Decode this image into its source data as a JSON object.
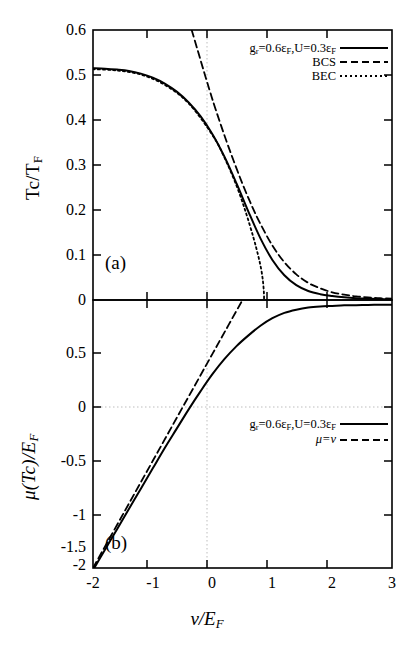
{
  "figure": {
    "panels": [
      "(a)",
      "(b)"
    ],
    "xaxis": {
      "label_html": "&nu;/E<sub>F</sub>",
      "min": -2,
      "max": 3,
      "ticks": [
        "-2",
        "-1",
        "0",
        "1",
        "2",
        "3"
      ]
    },
    "panel_a": {
      "label": "(a)",
      "ylabel_html": "Tc/T<sub>F</sub>",
      "yticks": [
        "0.6",
        "0.5",
        "0.4",
        "0.3",
        "0.2",
        "0.1",
        "0"
      ],
      "ymin": 0,
      "ymax": 0.6,
      "legend": [
        {
          "label_html": "g<sub>r</sub>=0.6&epsilon;<sub>F</sub>,U=0.3&epsilon;<sub>F</sub>",
          "style": "solid"
        },
        {
          "label_html": "BCS",
          "style": "dashed"
        },
        {
          "label_html": "BEC",
          "style": "dotted"
        }
      ]
    },
    "panel_b": {
      "label": "(b)",
      "ylabel_html": "&mu;(Tc)/E<sub>F</sub>",
      "yticks": [
        "0.5",
        "0",
        "-0.5",
        "-1",
        "-1.5",
        "-2"
      ],
      "ymin": -2,
      "ymax": 0.5,
      "legend": [
        {
          "label_html": "g<sub>r</sub>=0.6&epsilon;<sub>F</sub>,U=0.3&epsilon;<sub>F</sub>",
          "style": "solid"
        },
        {
          "label_html": "&mu;=&nu;",
          "style": "dashed"
        }
      ]
    },
    "colors": {
      "ink": "#000000",
      "grid": "#bdbdbd"
    }
  },
  "chart_data": {
    "type": "line",
    "title": "",
    "xlabel": "nu/E_F",
    "xlim": [
      -2,
      3
    ],
    "panels": [
      {
        "name": "(a)",
        "ylabel": "Tc/T_F",
        "ylim": [
          0,
          0.6
        ],
        "yticks": [
          0,
          0.1,
          0.2,
          0.3,
          0.4,
          0.5,
          0.6
        ],
        "xticks": [
          -2,
          -1,
          0,
          1,
          2,
          3
        ],
        "gridlines": {
          "vertical": [
            -0.15
          ],
          "horizontal": []
        },
        "series": [
          {
            "name": "g_r=0.6eps_F,U=0.3eps_F",
            "style": "solid",
            "x": [
              -2.0,
              -1.8,
              -1.6,
              -1.4,
              -1.2,
              -1.0,
              -0.8,
              -0.6,
              -0.4,
              -0.2,
              0.0,
              0.2,
              0.4,
              0.6,
              0.8,
              1.0,
              1.2,
              1.4,
              1.6,
              1.8,
              2.0,
              2.2,
              2.4,
              2.6,
              2.8,
              3.0
            ],
            "y": [
              0.515,
              0.514,
              0.512,
              0.509,
              0.503,
              0.494,
              0.481,
              0.463,
              0.439,
              0.408,
              0.368,
              0.318,
              0.259,
              0.196,
              0.137,
              0.089,
              0.055,
              0.033,
              0.02,
              0.013,
              0.009,
              0.006,
              0.004,
              0.003,
              0.002,
              0.002
            ]
          },
          {
            "name": "BCS",
            "style": "dashed",
            "x": [
              -0.35,
              -0.25,
              -0.15,
              -0.05,
              0.05,
              0.2,
              0.35,
              0.5,
              0.65,
              0.8,
              1.0,
              1.2,
              1.4,
              1.6,
              1.8,
              2.0,
              2.2,
              2.4,
              2.6,
              2.8,
              3.0
            ],
            "y": [
              0.6,
              0.555,
              0.51,
              0.466,
              0.424,
              0.365,
              0.31,
              0.258,
              0.211,
              0.169,
              0.121,
              0.084,
              0.057,
              0.038,
              0.026,
              0.017,
              0.012,
              0.008,
              0.006,
              0.004,
              0.003
            ]
          },
          {
            "name": "BEC",
            "style": "dotted",
            "x": [
              -2.0,
              -1.6,
              -1.2,
              -0.8,
              -0.4,
              0.0,
              0.2,
              0.4,
              0.55,
              0.68,
              0.76,
              0.81,
              0.84,
              0.855,
              0.86,
              0.86
            ],
            "y": [
              0.513,
              0.51,
              0.501,
              0.478,
              0.437,
              0.366,
              0.316,
              0.254,
              0.197,
              0.14,
              0.1,
              0.07,
              0.044,
              0.022,
              0.008,
              0.0
            ]
          }
        ]
      },
      {
        "name": "(b)",
        "ylabel": "mu(Tc)/E_F",
        "ylim": [
          -2.0,
          0.5
        ],
        "yticks": [
          0.5,
          0,
          -0.5,
          -1,
          -1.5,
          -2
        ],
        "xticks": [
          -2,
          -1,
          0,
          1,
          2,
          3
        ],
        "gridlines": {
          "vertical": [
            -0.15
          ],
          "horizontal": [
            0
          ]
        },
        "series": [
          {
            "name": "g_r=0.6eps_F,U=0.3eps_F",
            "style": "solid",
            "x": [
              -2.0,
              -1.8,
              -1.6,
              -1.4,
              -1.2,
              -1.0,
              -0.8,
              -0.6,
              -0.4,
              -0.2,
              0.0,
              0.2,
              0.4,
              0.6,
              0.8,
              1.0,
              1.2,
              1.4,
              1.6,
              1.8,
              2.0,
              2.2,
              2.4,
              2.6,
              2.8,
              3.0
            ],
            "y": [
              -2.02,
              -1.83,
              -1.64,
              -1.45,
              -1.26,
              -1.07,
              -0.88,
              -0.7,
              -0.52,
              -0.35,
              -0.19,
              -0.05,
              0.07,
              0.17,
              0.26,
              0.33,
              0.38,
              0.41,
              0.43,
              0.44,
              0.445,
              0.45,
              0.452,
              0.454,
              0.455,
              0.456
            ]
          },
          {
            "name": "mu=nu",
            "style": "dashed",
            "x": [
              -2.0,
              -1.5,
              -1.0,
              -0.5,
              0.0,
              0.2,
              0.4,
              0.5
            ],
            "y": [
              -2.0,
              -1.5,
              -1.0,
              -0.5,
              0.0,
              0.2,
              0.4,
              0.5
            ]
          }
        ]
      }
    ]
  }
}
